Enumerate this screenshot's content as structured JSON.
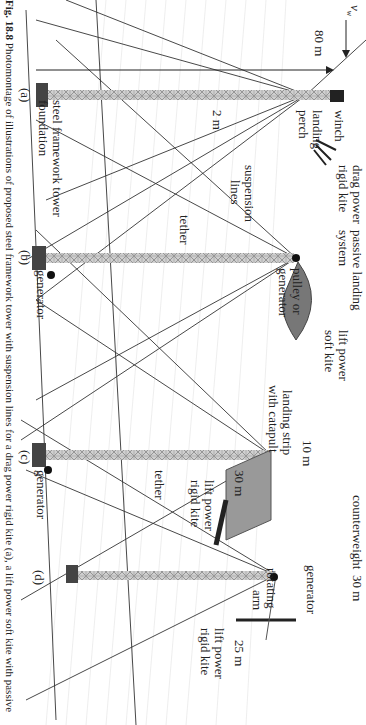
{
  "figure": {
    "caption_label": "Fig. 18.8",
    "caption_text": "Photomontage of illustrations of proposed steel framework tower with suspension lines for a drag power rigid kite (a), a lift power soft kite with passive"
  },
  "labels": {
    "wind_speed": "v",
    "wind_speed_sub": "w",
    "height_80m": "80 m",
    "width_2m": "2 m",
    "winch": "winch",
    "landing_perch_1": "landing",
    "landing_perch_2": "perch",
    "drag_kite_1": "drag power",
    "drag_kite_2": "rigid kite",
    "suspension_1": "suspension",
    "suspension_2": "lines",
    "steel_tower": "steel framework tower",
    "foundation": "foundation",
    "passive_landing_1": "passive landing",
    "passive_landing_2": "system",
    "lift_soft_1": "lift power",
    "lift_soft_2": "soft kite",
    "pulley_1": "pulley or",
    "pulley_2": "generator",
    "tether_b": "tether",
    "generator_b": "generator",
    "landing_strip_1": "landing strip",
    "landing_strip_2": "with catapult",
    "dim_10m": "10 m",
    "dim_30m_c": "30 m",
    "lift_rigid_c_1": "lift power",
    "lift_rigid_c_2": "rigid kite",
    "tether_c": "tether",
    "generator_c": "generator",
    "counterweight": "counterweight",
    "generator_d": "generator",
    "dim_30m_d": "30 m",
    "rotating_1": "rotating",
    "rotating_2": "arm",
    "dim_25m": "25 m",
    "lift_rigid_d_1": "lift power",
    "lift_rigid_d_2": "rigid kite"
  },
  "panels": [
    "(a)",
    "(b)",
    "(c)",
    "(d)"
  ]
}
